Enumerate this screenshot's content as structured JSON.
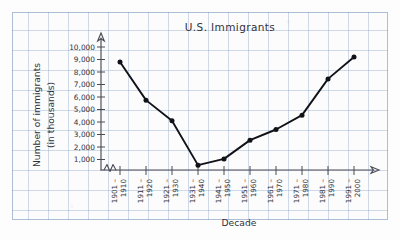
{
  "chart_data": {
    "type": "line",
    "title": "U.S. Immigrants",
    "xlabel": "Decade",
    "ylabel_line1": "Number of immigrants",
    "ylabel_line2": "(in thousands)",
    "categories": [
      "1901 –\n1910",
      "1911 –\n1920",
      "1921 –\n1930",
      "1931 –\n1940",
      "1941 –\n1950",
      "1951 –\n1960",
      "1961 –\n1970",
      "1971 –\n1980",
      "1981 –\n1990",
      "1991 –\n2000"
    ],
    "category_top_labels": [
      "1901 –",
      "1911 –",
      "1921 –",
      "1931 –",
      "1941 –",
      "1951 –",
      "1961 –",
      "1971 –",
      "1981 –",
      "1991 –"
    ],
    "category_bottom_labels": [
      "1910",
      "1920",
      "1930",
      "1940",
      "1950",
      "1960",
      "1970",
      "1980",
      "1990",
      "2000"
    ],
    "values": [
      8800,
      5750,
      4100,
      550,
      1050,
      2550,
      3400,
      4550,
      7450,
      9200
    ],
    "ytick_labels": [
      "1,000",
      "2,000",
      "3,000",
      "4,000",
      "5,000",
      "6,000",
      "7,000",
      "8,000",
      "9,000",
      "10,000"
    ],
    "ytick_values": [
      1000,
      2000,
      3000,
      4000,
      5000,
      6000,
      7000,
      8000,
      9000,
      10000
    ],
    "ylim": [
      0,
      10000
    ],
    "grid": true,
    "legend": "none",
    "axis_break": "zigzag on x-axis near origin",
    "line_color": "#111118",
    "marker_color": "#111118",
    "grid_color": "#7896be",
    "paper_color": "#fcfcfd"
  }
}
